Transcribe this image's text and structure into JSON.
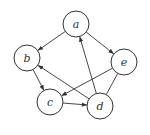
{
  "diagram": {
    "type": "directed-graph",
    "nodes": [
      {
        "id": "a",
        "label": "a"
      },
      {
        "id": "b",
        "label": "b"
      },
      {
        "id": "c",
        "label": "c"
      },
      {
        "id": "d",
        "label": "d"
      },
      {
        "id": "e",
        "label": "e"
      }
    ],
    "edges": [
      {
        "from": "a",
        "to": "b",
        "directed": true
      },
      {
        "from": "a",
        "to": "e",
        "directed": true
      },
      {
        "from": "b",
        "to": "c",
        "directed": true
      },
      {
        "from": "c",
        "to": "d",
        "directed": true
      },
      {
        "from": "d",
        "to": "a",
        "directed": true
      },
      {
        "from": "d",
        "to": "b",
        "directed": true
      },
      {
        "from": "e",
        "to": "c",
        "directed": true
      },
      {
        "from": "e",
        "to": "d",
        "directed": false
      }
    ],
    "colors": {
      "stroke": "#333333",
      "fill": "#ffffff"
    }
  }
}
